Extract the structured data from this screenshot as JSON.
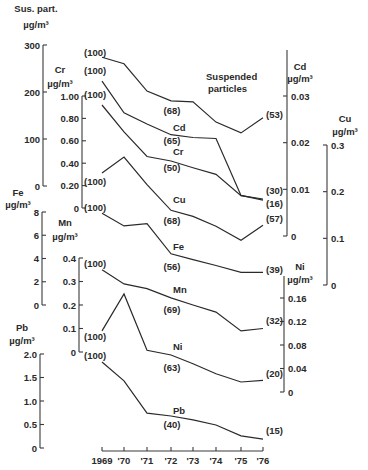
{
  "chart_data": {
    "type": "line",
    "title": "",
    "xlabel": "",
    "x": [
      "1969",
      "'70",
      "'71",
      "'72",
      "'73",
      "'74",
      "'75",
      "'76"
    ],
    "series": [
      {
        "name": "Suspended particles",
        "axis_label": "Sus. part.",
        "unit": "µg/m³",
        "axis_side": "left",
        "ticks": [
          "0",
          "100",
          "200",
          "300"
        ],
        "ylim": [
          0,
          300
        ],
        "values": [
          274,
          260,
          202,
          181,
          179,
          136,
          113,
          145
        ],
        "annotations": [
          {
            "text": "(100)",
            "year": "1969"
          },
          {
            "text": "(68)",
            "year": "'72"
          },
          {
            "text": "(53)",
            "year": "'76"
          }
        ]
      },
      {
        "name": "Cd",
        "axis_label": "Cd",
        "unit": "µg/m³",
        "axis_side": "right",
        "ticks": [
          "0",
          "0.01",
          "0.02",
          "0.03"
        ],
        "ylim": [
          0,
          0.03
        ],
        "values": [
          0.0332,
          0.0264,
          0.024,
          0.0217,
          0.0211,
          0.0209,
          0.0087,
          0.0077
        ],
        "annotations": [
          {
            "text": "(100)",
            "year": "1969"
          },
          {
            "text": "(65)",
            "year": "'72"
          },
          {
            "text": "(30)",
            "year": "'76"
          }
        ]
      },
      {
        "name": "Cr",
        "axis_label": "Cr",
        "unit": "µg/m³",
        "axis_side": "left",
        "ticks": [
          "0",
          "0.20",
          "0.40",
          "0.60",
          "0.80",
          "1.00"
        ],
        "ylim": [
          0,
          1.0
        ],
        "values": [
          0.92,
          0.68,
          0.46,
          0.42,
          0.36,
          0.3,
          0.11,
          0.08
        ],
        "annotations": [
          {
            "text": "(100)",
            "year": "1969"
          },
          {
            "text": "(50)",
            "year": "'72"
          },
          {
            "text": "(16)",
            "year": "'76"
          }
        ]
      },
      {
        "name": "Cu",
        "axis_label": "Cu",
        "unit": "µg/m³",
        "axis_side": "right",
        "ticks": [
          "0",
          "0.1",
          "0.2",
          "0.3"
        ],
        "ylim": [
          0,
          0.3
        ],
        "values": [
          0.24,
          0.274,
          0.215,
          0.16,
          0.147,
          0.126,
          0.096,
          0.128
        ],
        "annotations": [
          {
            "text": "(100)",
            "year": "1969"
          },
          {
            "text": "(68)",
            "year": "'72"
          },
          {
            "text": "(57)",
            "year": "'76"
          }
        ]
      },
      {
        "name": "Fe",
        "axis_label": "Fe",
        "unit": "µg/m³",
        "axis_side": "left",
        "ticks": [
          "0",
          "2",
          "4",
          "6",
          "8"
        ],
        "ylim": [
          0,
          8
        ],
        "values": [
          7.9,
          6.8,
          7.0,
          4.4,
          3.9,
          3.4,
          2.8,
          2.8
        ],
        "annotations": [
          {
            "text": "(100)",
            "year": "1969"
          },
          {
            "text": "(56)",
            "year": "'72"
          },
          {
            "text": "(39)",
            "year": "'76"
          }
        ]
      },
      {
        "name": "Mn",
        "axis_label": "Mn",
        "unit": "µg/m³",
        "axis_side": "left",
        "ticks": [
          "0",
          "0.1",
          "0.2",
          "0.3",
          "0.4"
        ],
        "ylim": [
          0,
          0.4
        ],
        "values": [
          0.35,
          0.29,
          0.27,
          0.23,
          0.2,
          0.17,
          0.09,
          0.1
        ],
        "annotations": [
          {
            "text": "(100)",
            "year": "1969"
          },
          {
            "text": "(69)",
            "year": "'72"
          },
          {
            "text": "(32)",
            "year": "'76"
          }
        ]
      },
      {
        "name": "Ni",
        "axis_label": "Ni",
        "unit": "µg/m³",
        "axis_side": "right",
        "ticks": [
          "0",
          "0.04",
          "0.08",
          "0.12",
          "0.16"
        ],
        "ylim": [
          0,
          0.16
        ],
        "values": [
          0.104,
          0.167,
          0.071,
          0.063,
          0.048,
          0.031,
          0.017,
          0.02
        ],
        "annotations": [
          {
            "text": "(100)",
            "year": "1969"
          },
          {
            "text": "(63)",
            "year": "'72"
          },
          {
            "text": "(20)",
            "year": "'76"
          }
        ]
      },
      {
        "name": "Pb",
        "axis_label": "Pb",
        "unit": "µg/m³",
        "axis_side": "left",
        "ticks": [
          "0",
          "0.5",
          "1.0",
          "1.5",
          "2.0"
        ],
        "ylim": [
          0,
          2.0
        ],
        "values": [
          1.83,
          1.43,
          0.74,
          0.68,
          0.6,
          0.49,
          0.26,
          0.19
        ],
        "annotations": [
          {
            "text": "(100)",
            "year": "1969"
          },
          {
            "text": "(40)",
            "year": "'72"
          },
          {
            "text": "(15)",
            "year": "'76"
          }
        ]
      }
    ],
    "grid": false,
    "legend": "inline labels"
  },
  "layout": {
    "x_pixels": [
      102,
      124,
      147,
      171,
      193,
      216,
      241,
      263
    ],
    "x_axis_y": 451,
    "axes": [
      {
        "series": 0,
        "x": 43,
        "y0": 186,
        "y1": 45,
        "label_x": 36,
        "unit_x": 36,
        "label_y": 12,
        "unit_y": 28,
        "tick_side": "left",
        "label_anchor": "middle",
        "name_label_x": 38
      },
      {
        "series": 1,
        "x": 287,
        "y0": 236,
        "y1": 96,
        "label_x": 300,
        "label_y": 70,
        "unit_y": 82,
        "tick_side": "right",
        "top": 50
      },
      {
        "series": 2,
        "x": 82,
        "y0": 208,
        "y1": 96,
        "label_x": 60,
        "label_y": 73,
        "unit_y": 87,
        "tick_side": "left"
      },
      {
        "series": 3,
        "x": 327,
        "y0": 285,
        "y1": 145,
        "label_x": 345,
        "label_y": 122,
        "unit_y": 135,
        "tick_side": "right"
      },
      {
        "series": 4,
        "x": 42,
        "y0": 305,
        "y1": 212,
        "label_x": 18,
        "label_y": 196,
        "unit_y": 208,
        "tick_side": "left"
      },
      {
        "series": 5,
        "x": 79,
        "y0": 352,
        "y1": 258,
        "label_x": 65,
        "label_y": 226,
        "unit_y": 240,
        "tick_side": "left"
      },
      {
        "series": 6,
        "x": 284,
        "y0": 392,
        "y1": 298,
        "label_x": 300,
        "label_y": 270,
        "unit_y": 283,
        "tick_side": "right",
        "top": 276
      },
      {
        "series": 7,
        "x": 40,
        "y0": 448,
        "y1": 354,
        "label_x": 22,
        "label_y": 331,
        "unit_y": 344,
        "tick_side": "left"
      }
    ],
    "labels": [
      {
        "series": 0,
        "name_pos": [
          206,
          80
        ],
        "name_line2": "particles",
        "name_line2_pos": [
          208,
          92
        ],
        "first_pos": [
          84,
          56
        ],
        "mid_pos": [
          172,
          114
        ],
        "last_pos": [
          266,
          118
        ]
      },
      {
        "series": 1,
        "name_pos": [
          173,
          131
        ],
        "first_pos": [
          84,
          74
        ],
        "mid_pos": [
          172,
          144
        ],
        "last_pos": [
          266,
          194
        ]
      },
      {
        "series": 2,
        "name_pos": [
          173,
          155
        ],
        "first_pos": [
          84,
          98
        ],
        "mid_pos": [
          172,
          171
        ],
        "last_pos": [
          266,
          207
        ]
      },
      {
        "series": 3,
        "name_pos": [
          173,
          203
        ],
        "first_pos": [
          84,
          185
        ],
        "mid_pos": [
          172,
          224
        ],
        "last_pos": [
          266,
          222
        ]
      },
      {
        "series": 4,
        "name_pos": [
          173,
          250
        ],
        "first_pos": [
          84,
          211
        ],
        "mid_pos": [
          172,
          270
        ],
        "last_pos": [
          266,
          273
        ]
      },
      {
        "series": 5,
        "name_pos": [
          173,
          293
        ],
        "first_pos": [
          84,
          267
        ],
        "mid_pos": [
          172,
          313
        ],
        "last_pos": [
          266,
          324
        ]
      },
      {
        "series": 6,
        "name_pos": [
          173,
          350
        ],
        "first_pos": [
          84,
          340
        ],
        "mid_pos": [
          172,
          371
        ],
        "last_pos": [
          266,
          377
        ]
      },
      {
        "series": 7,
        "name_pos": [
          173,
          414
        ],
        "first_pos": [
          84,
          359
        ],
        "mid_pos": [
          172,
          428
        ],
        "last_pos": [
          266,
          434
        ]
      }
    ]
  }
}
